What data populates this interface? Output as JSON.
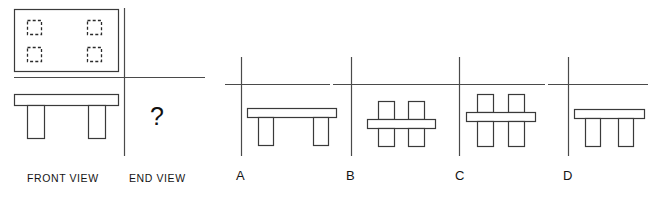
{
  "puzzle": {
    "type": "orthographic-projection-multiple-choice",
    "prompt_symbol": "?",
    "given_views": [
      {
        "key": "top",
        "label": "",
        "description": "rectangular tabletop plan with four hidden (dashed) square legs"
      },
      {
        "key": "front",
        "label": "FRONT VIEW",
        "description": "wide bench: horizontal top slab with two rectangular legs"
      }
    ],
    "missing_view": {
      "key": "end",
      "label": "END VIEW"
    }
  },
  "captions": {
    "front_view": "FRONT VIEW",
    "end_view": "END VIEW"
  },
  "options": [
    {
      "label": "A",
      "description": "wide top slab with two legs below, same width as front view",
      "top_width": 100,
      "legs": 2,
      "legs_above_slab": false
    },
    {
      "label": "B",
      "description": "narrow horizontal slab with two stub legs above and two legs below",
      "top_width": 70,
      "legs": 2,
      "legs_above_slab": true
    },
    {
      "label": "C",
      "description": "narrow horizontal slab with two stub legs above and two long legs below",
      "top_width": 72,
      "legs": 2,
      "legs_above_slab": true
    },
    {
      "label": "D",
      "description": "narrow top slab with two legs below",
      "top_width": 72,
      "legs": 2,
      "legs_above_slab": false
    }
  ],
  "colors": {
    "background": "#ffffff",
    "line": "#3a3a3a",
    "axis": "#4a4a4a",
    "hidden_line": "#2b2b2b",
    "text": "#151515"
  },
  "geometry": {
    "top_view": {
      "x": 14,
      "y": 9,
      "width": 104,
      "height": 62
    },
    "hidden_squares": [
      {
        "x": 27,
        "y": 20,
        "size": 14
      },
      {
        "x": 87,
        "y": 20,
        "size": 14
      },
      {
        "x": 27,
        "y": 47,
        "size": 14
      },
      {
        "x": 87,
        "y": 47,
        "size": 14
      }
    ],
    "front_view": {
      "slab": {
        "x": 14,
        "y": 94,
        "width": 104,
        "height": 11
      },
      "legs": [
        {
          "x": 27,
          "y": 105,
          "width": 17,
          "height": 33
        },
        {
          "x": 88,
          "y": 105,
          "width": 17,
          "height": 33
        }
      ]
    },
    "divider_vertical": {
      "x": 124,
      "y1": 8,
      "y2": 156
    },
    "divider_horizontal": {
      "y": 77,
      "x1": 14,
      "x2": 205
    },
    "question_mark": {
      "x": 150,
      "y": 104
    }
  }
}
